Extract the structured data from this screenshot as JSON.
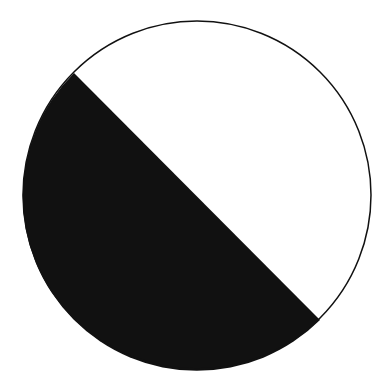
{
  "diagram": {
    "type": "circle-segment",
    "circle": {
      "cx": 197,
      "cy": 195,
      "r": 174
    },
    "chord": {
      "x1": 74,
      "y1": 73,
      "x2": 320,
      "y2": 320
    },
    "colors": {
      "fill": "#111111",
      "stroke": "#111111",
      "background": "#ffffff"
    }
  }
}
